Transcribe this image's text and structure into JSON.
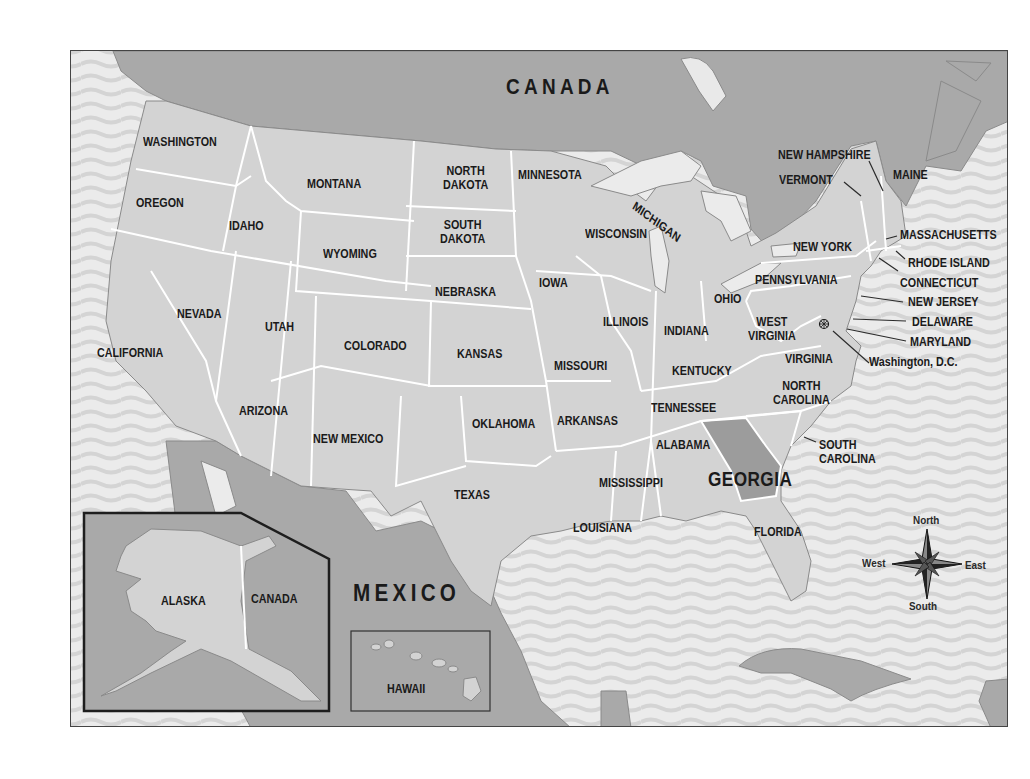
{
  "map": {
    "title_countries": {
      "canada": "CANADA",
      "mexico": "MEXICO",
      "canada_inset": "CANADA"
    },
    "highlighted_state": "GEORGIA",
    "states": {
      "washington": "WASHINGTON",
      "oregon": "OREGON",
      "california": "CALIFORNIA",
      "idaho": "IDAHO",
      "nevada": "NEVADA",
      "montana": "MONTANA",
      "wyoming": "WYOMING",
      "utah": "UTAH",
      "arizona": "ARIZONA",
      "colorado": "COLORADO",
      "new_mexico": "NEW MEXICO",
      "north_dakota": "NORTH\nDAKOTA",
      "south_dakota": "SOUTH\nDAKOTA",
      "nebraska": "NEBRASKA",
      "kansas": "KANSAS",
      "oklahoma": "OKLAHOMA",
      "texas": "TEXAS",
      "minnesota": "MINNESOTA",
      "iowa": "IOWA",
      "missouri": "MISSOURI",
      "arkansas": "ARKANSAS",
      "louisiana": "LOUISIANA",
      "wisconsin": "WISCONSIN",
      "michigan": "MICHIGAN",
      "illinois": "ILLINOIS",
      "indiana": "INDIANA",
      "ohio": "OHIO",
      "kentucky": "KENTUCKY",
      "tennessee": "TENNESSEE",
      "mississippi": "MISSISSIPPI",
      "alabama": "ALABAMA",
      "georgia": "GEORGIA",
      "florida": "FLORIDA",
      "south_carolina": "SOUTH\nCAROLINA",
      "north_carolina": "NORTH\nCAROLINA",
      "virginia": "VIRGINIA",
      "west_virginia": "WEST\nVIRGINIA",
      "pennsylvania": "PENNSYLVANIA",
      "new_york": "NEW YORK",
      "vermont": "VERMONT",
      "new_hampshire": "NEW HAMPSHIRE",
      "maine": "MAINE",
      "massachusetts": "MASSACHUSETTS",
      "rhode_island": "RHODE ISLAND",
      "connecticut": "CONNECTICUT",
      "new_jersey": "NEW JERSEY",
      "delaware": "DELAWARE",
      "maryland": "MARYLAND",
      "alaska": "ALASKA",
      "hawaii": "HAWAII"
    },
    "capital_label": "Washington, D.C.",
    "compass": {
      "north": "North",
      "south": "South",
      "east": "East",
      "west": "West"
    },
    "colors": {
      "us_land": "#d3d3d3",
      "foreign_land": "#a9a9a9",
      "water": "#ebebeb",
      "water_wave": "#d5d5d5",
      "highlight": "#9c9c9c",
      "border": "#ffffff",
      "text": "#1a1a1a"
    }
  }
}
